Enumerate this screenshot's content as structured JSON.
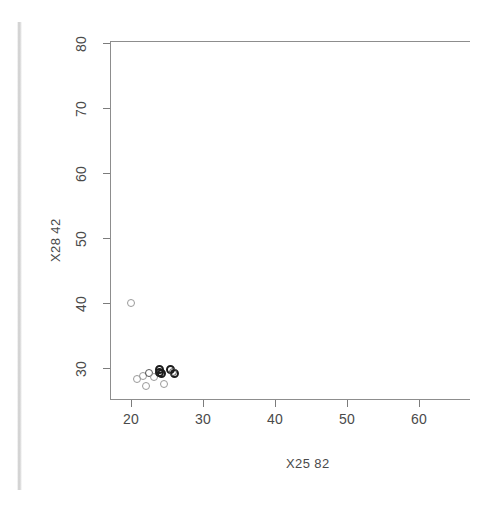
{
  "chart_data": {
    "type": "scatter",
    "title": "",
    "xlabel": "X25.82",
    "ylabel": "X28.42",
    "xlim": [
      17.0,
      67.0
    ],
    "ylim": [
      25.0,
      82.0
    ],
    "xticks": [
      20,
      30,
      40,
      50,
      60
    ],
    "xticklabels": [
      "20",
      "30",
      "40",
      "50",
      "60"
    ],
    "yticks": [
      30,
      40,
      50,
      60,
      70,
      80
    ],
    "yticklabels": [
      "30",
      "40",
      "50",
      "60",
      "70",
      "80"
    ],
    "grid": false,
    "legend": null,
    "marker": "open-circle",
    "marker_color": "#555555",
    "frame": "top-left-bottom",
    "points": [
      {
        "x": 20.0,
        "y": 40.0,
        "weight": "faint"
      },
      {
        "x": 20.8,
        "y": 28.3,
        "weight": "faint"
      },
      {
        "x": 21.6,
        "y": 28.8,
        "weight": "faint"
      },
      {
        "x": 22.1,
        "y": 27.2,
        "weight": "faint"
      },
      {
        "x": 22.5,
        "y": 29.2,
        "weight": "normal"
      },
      {
        "x": 23.2,
        "y": 28.6,
        "weight": "faint"
      },
      {
        "x": 23.9,
        "y": 29.8,
        "weight": "dark"
      },
      {
        "x": 24.3,
        "y": 29.2,
        "weight": "dark"
      },
      {
        "x": 24.0,
        "y": 29.3,
        "weight": "dark"
      },
      {
        "x": 24.6,
        "y": 27.6,
        "weight": "faint"
      },
      {
        "x": 25.5,
        "y": 29.7,
        "weight": "dark"
      },
      {
        "x": 26.0,
        "y": 29.2,
        "weight": "dark"
      },
      {
        "x": 25.8,
        "y": 29.4,
        "weight": "normal"
      }
    ]
  },
  "axes": {
    "y_title": "X28 42",
    "x_title": "X25 82",
    "y_ticklabels": [
      "80",
      "70",
      "60",
      "50",
      "40",
      "30"
    ],
    "x_ticklabels": [
      "20",
      "30",
      "40",
      "50",
      "60"
    ]
  }
}
